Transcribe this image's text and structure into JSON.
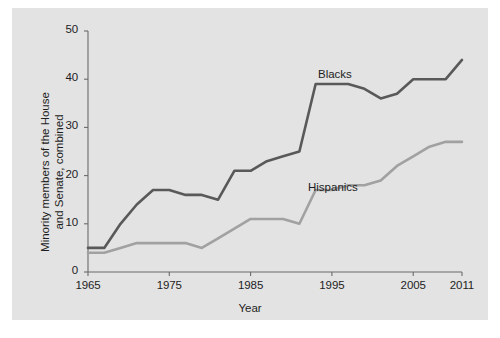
{
  "chart_data": {
    "type": "line",
    "title": "",
    "xlabel": "Year",
    "ylabel": "Minority members of the House and Senate, combined",
    "ylabel_line1": "Minority members of the House",
    "ylabel_line2": "and Senate, combined",
    "xlim": [
      1965,
      2011
    ],
    "ylim": [
      0,
      50
    ],
    "xticks": [
      1965,
      1975,
      1985,
      1995,
      2005,
      2011
    ],
    "xtick_labels": [
      "1965",
      "1975",
      "1985",
      "1995",
      "2005",
      "2011"
    ],
    "yticks": [
      0,
      10,
      20,
      30,
      40,
      50
    ],
    "ytick_labels": [
      "0",
      "10",
      "20",
      "30",
      "40",
      "50"
    ],
    "grid": false,
    "legend_position": "inline-annotations",
    "background_color": "#e3e3e3",
    "axis_color": "#6b6b6b",
    "series": [
      {
        "name": "Blacks",
        "color": "#595959",
        "label_x": 1996,
        "label_y": 43,
        "x": [
          1965,
          1967,
          1969,
          1971,
          1973,
          1975,
          1977,
          1979,
          1981,
          1983,
          1985,
          1987,
          1989,
          1991,
          1993,
          1995,
          1997,
          1999,
          2001,
          2003,
          2005,
          2007,
          2009,
          2011
        ],
        "values": [
          5,
          5,
          10,
          14,
          17,
          17,
          16,
          16,
          15,
          21,
          21,
          23,
          24,
          25,
          39,
          39,
          39,
          38,
          36,
          37,
          40,
          40,
          40,
          44
        ]
      },
      {
        "name": "Hispanics",
        "color": "#a1a1a1",
        "label_x": 1991,
        "label_y": 20,
        "x": [
          1965,
          1967,
          1969,
          1971,
          1973,
          1975,
          1977,
          1979,
          1981,
          1983,
          1985,
          1987,
          1989,
          1991,
          1993,
          1995,
          1997,
          1999,
          2001,
          2003,
          2005,
          2007,
          2009,
          2011
        ],
        "values": [
          4,
          4,
          5,
          6,
          6,
          6,
          6,
          5,
          7,
          9,
          11,
          11,
          11,
          10,
          17,
          17,
          18,
          18,
          19,
          22,
          24,
          26,
          27,
          27
        ]
      }
    ]
  }
}
